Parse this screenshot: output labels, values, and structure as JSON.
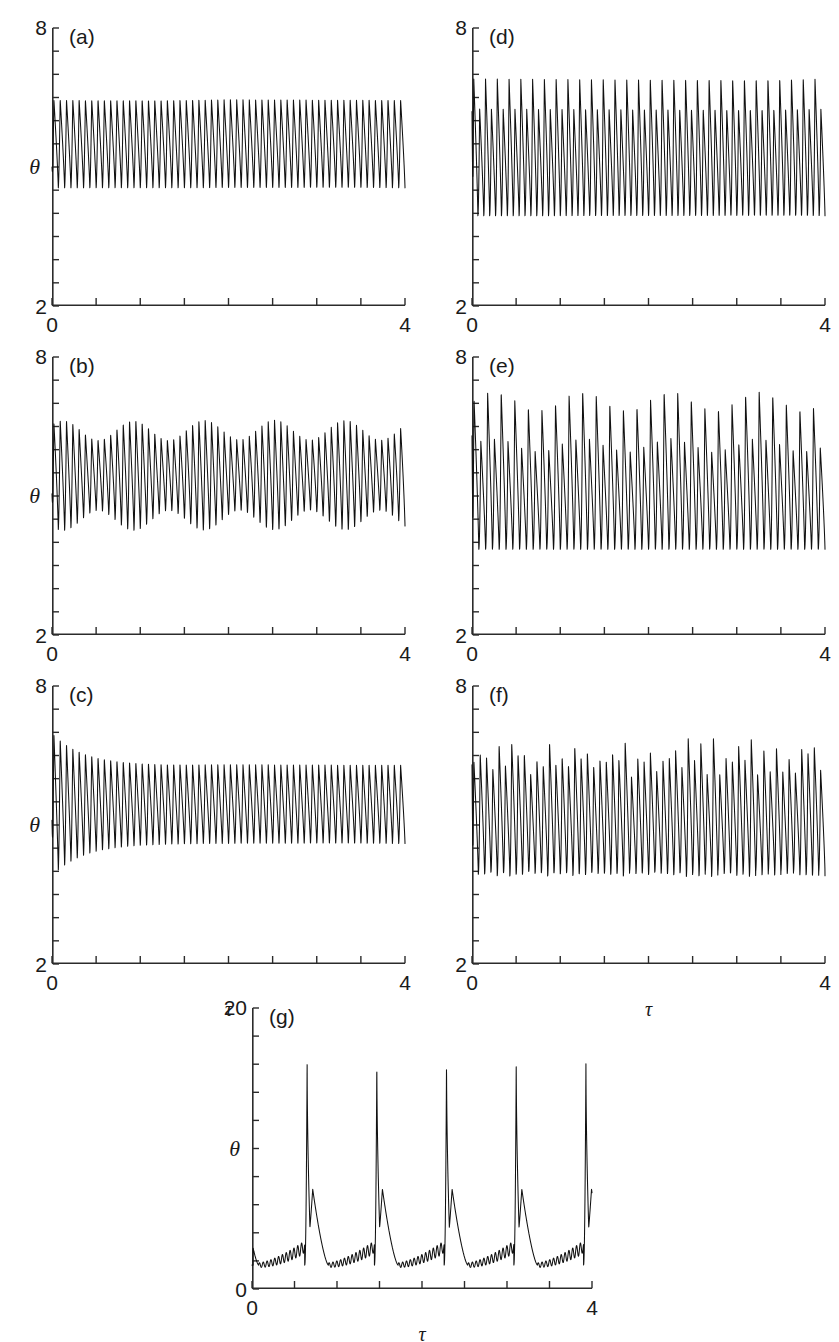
{
  "figure": {
    "axis_label_x": "τ",
    "axis_label_y": "θ",
    "header_faint": ""
  },
  "chart_data": [
    {
      "type": "line",
      "panel": "(a)",
      "title": "",
      "xlabel": "τ",
      "ylabel": "θ",
      "xlim": [
        0,
        4
      ],
      "ylim": [
        2,
        8
      ],
      "xticks": [
        0,
        4
      ],
      "xtick_labels": [
        "0",
        "4"
      ],
      "x_minor_step": 0.5,
      "yticks": [
        2,
        8
      ],
      "ytick_labels": [
        "2",
        "8"
      ],
      "y_minor_step": 0.5,
      "grid": false,
      "legend": "none",
      "description": "period-1 limit cycle, constant amplitude",
      "regime": "period-1",
      "cycles": 56,
      "peak": 6.45,
      "trough": 4.55,
      "baseline": 5.5,
      "start_value": 5.0
    },
    {
      "type": "line",
      "panel": "(b)",
      "title": "",
      "xlabel": "τ",
      "ylabel": "θ",
      "xlim": [
        0,
        4
      ],
      "ylim": [
        2,
        8
      ],
      "xticks": [
        0,
        4
      ],
      "xtick_labels": [
        "0",
        "4"
      ],
      "x_minor_step": 0.5,
      "yticks": [
        2,
        8
      ],
      "ytick_labels": [
        "2",
        "8"
      ],
      "y_minor_step": 0.5,
      "grid": false,
      "legend": "none",
      "description": "quasi-periodic, slowly modulated amplitude",
      "regime": "quasi-periodic",
      "cycles": 56,
      "peak": 6.45,
      "trough": 4.5,
      "baseline": 5.45,
      "modulation_depth": 0.22,
      "modulation_cycles": 5,
      "start_value": 5.05
    },
    {
      "type": "line",
      "panel": "(c)",
      "title": "",
      "xlabel": "τ",
      "ylabel": "θ",
      "xlim": [
        0,
        4
      ],
      "ylim": [
        2,
        8
      ],
      "xticks": [
        0,
        4
      ],
      "xtick_labels": [
        "0",
        "4"
      ],
      "x_minor_step": 0.5,
      "yticks": [
        2,
        8
      ],
      "ytick_labels": [
        "2",
        "8"
      ],
      "y_minor_step": 0.5,
      "grid": false,
      "legend": "none",
      "description": "large initial transient decaying onto a period-1 limit cycle",
      "regime": "damped transient to period-1",
      "cycles": 56,
      "peak": 6.3,
      "trough": 4.6,
      "baseline": 5.45,
      "transient_peak": 7.05,
      "transient_trough": 3.95,
      "transient_decay_tau": 0.35,
      "start_value": 5.1
    },
    {
      "type": "line",
      "panel": "(d)",
      "title": "",
      "xlabel": "τ",
      "ylabel": "θ",
      "xlim": [
        0,
        4
      ],
      "ylim": [
        2,
        8
      ],
      "xticks": [
        0,
        4
      ],
      "xtick_labels": [
        "0",
        "4"
      ],
      "x_minor_step": 0.5,
      "yticks": [
        2,
        8
      ],
      "ytick_labels": [
        "2",
        "8"
      ],
      "y_minor_step": 0.5,
      "grid": false,
      "legend": "none",
      "description": "period-2: alternating tall and short spikes",
      "regime": "period-2",
      "cycles": 60,
      "peak_tall": 6.9,
      "peak_short": 6.25,
      "trough": 3.95,
      "baseline": 5.2,
      "start_value": 6.2
    },
    {
      "type": "line",
      "panel": "(e)",
      "title": "",
      "xlabel": "τ",
      "ylabel": "θ",
      "xlim": [
        0,
        4
      ],
      "ylim": [
        2,
        8
      ],
      "xticks": [
        0,
        4
      ],
      "xtick_labels": [
        "0",
        "4"
      ],
      "x_minor_step": 0.5,
      "yticks": [
        2,
        8
      ],
      "ytick_labels": [
        "2",
        "8"
      ],
      "y_minor_step": 0.5,
      "grid": false,
      "legend": "none",
      "description": "period-2 with larger spike amplitude and slow modulation",
      "regime": "period-2 modulated",
      "cycles": 52,
      "peak_tall": 7.05,
      "peak_short": 6.1,
      "trough": 3.85,
      "baseline": 5.1,
      "modulation_depth": 0.18,
      "modulation_cycles": 4,
      "start_value": 6.3
    },
    {
      "type": "line",
      "panel": "(f)",
      "title": "",
      "xlabel": "τ",
      "ylabel": "θ",
      "xlim": [
        0,
        4
      ],
      "ylim": [
        2,
        8
      ],
      "xticks": [
        0,
        4
      ],
      "xtick_labels": [
        "0",
        "4"
      ],
      "x_minor_step": 0.5,
      "yticks": [
        2,
        8
      ],
      "ytick_labels": [
        "2",
        "8"
      ],
      "y_minor_step": 0.5,
      "grid": false,
      "legend": "none",
      "description": "chaotic: irregular spike heights from cycle to cycle",
      "regime": "chaotic",
      "cycles": 56,
      "peak_max": 7.1,
      "peak_min": 5.9,
      "trough": 3.85,
      "baseline": 5.15,
      "start_value": 6.3
    },
    {
      "type": "line",
      "panel": "(g)",
      "title": "",
      "xlabel": "τ",
      "ylabel": "θ",
      "xlim": [
        0,
        4
      ],
      "ylim": [
        0,
        20
      ],
      "xticks": [
        0,
        4
      ],
      "xtick_labels": [
        "0",
        "4"
      ],
      "x_minor_step": 0.5,
      "yticks": [
        0,
        20
      ],
      "ytick_labels": [
        "0",
        "20"
      ],
      "y_minor_step": 2,
      "grid": false,
      "legend": "none",
      "description": "relaxation bursting: four large spikes with a secondary shoulder peak, slow rippled recovery between bursts",
      "regime": "bursting / relaxation oscillation",
      "bursts": 4,
      "burst_period": 0.82,
      "first_burst_time": 0.62,
      "spike_peak": 16.2,
      "shoulder_peak": 7.1,
      "quiescent_level": 1.7,
      "ripple_amplitude": 0.45,
      "ripples_per_interval": 12
    }
  ],
  "panels": [
    {
      "id": "a",
      "label": "(a)",
      "ymax_label": "8",
      "ymin_label": "2",
      "x0_label": "0",
      "x1_label": "4",
      "xaxis_label": "",
      "yaxis_label": "θ"
    },
    {
      "id": "d",
      "label": "(d)",
      "ymax_label": "8",
      "ymin_label": "2",
      "x0_label": "0",
      "x1_label": "4",
      "xaxis_label": "",
      "yaxis_label": ""
    },
    {
      "id": "b",
      "label": "(b)",
      "ymax_label": "8",
      "ymin_label": "2",
      "x0_label": "0",
      "x1_label": "4",
      "xaxis_label": "",
      "yaxis_label": "θ"
    },
    {
      "id": "e",
      "label": "(e)",
      "ymax_label": "8",
      "ymin_label": "2",
      "x0_label": "0",
      "x1_label": "4",
      "xaxis_label": "",
      "yaxis_label": ""
    },
    {
      "id": "c",
      "label": "(c)",
      "ymax_label": "8",
      "ymin_label": "2",
      "x0_label": "0",
      "x1_label": "4",
      "xaxis_label": "τ",
      "yaxis_label": "θ"
    },
    {
      "id": "f",
      "label": "(f)",
      "ymax_label": "8",
      "ymin_label": "2",
      "x0_label": "0",
      "x1_label": "4",
      "xaxis_label": "τ",
      "yaxis_label": ""
    },
    {
      "id": "g",
      "label": "(g)",
      "ymax_label": "20",
      "ymin_label": "0",
      "x0_label": "0",
      "x1_label": "4",
      "xaxis_label": "τ",
      "yaxis_label": "θ"
    }
  ]
}
